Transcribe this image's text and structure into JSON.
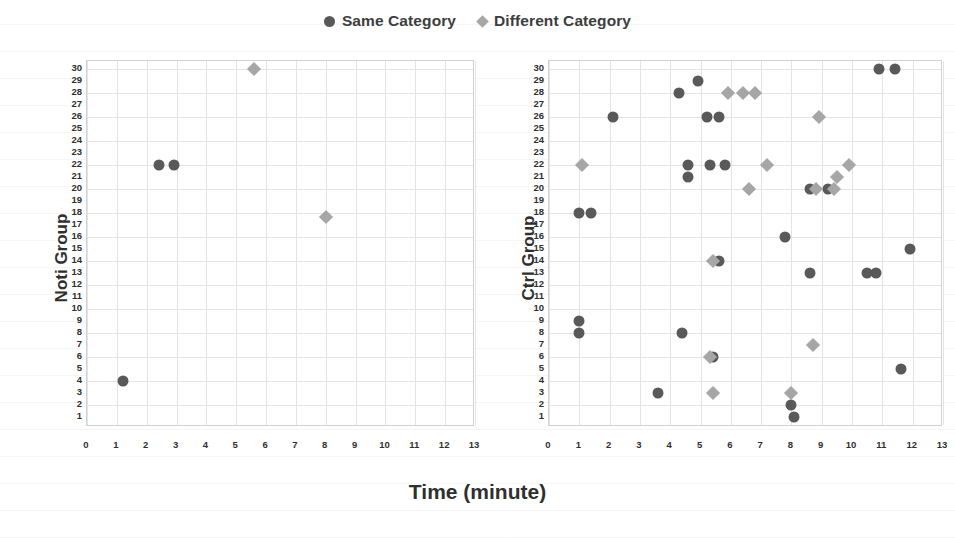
{
  "legend": {
    "items": [
      {
        "label": "Same Category",
        "marker": "circle",
        "color": "#595959"
      },
      {
        "label": "Different Category",
        "marker": "diamond",
        "color": "#a6a6a6"
      }
    ]
  },
  "axis": {
    "xlabel": "Time (minute)",
    "xticks": [
      0,
      1,
      2,
      3,
      4,
      5,
      6,
      7,
      8,
      9,
      10,
      11,
      12,
      13
    ],
    "yticks": [
      1,
      2,
      3,
      4,
      5,
      6,
      7,
      8,
      9,
      10,
      11,
      12,
      13,
      14,
      15,
      16,
      17,
      18,
      19,
      20,
      21,
      22,
      23,
      24,
      25,
      26,
      27,
      28,
      29,
      30
    ]
  },
  "panels": [
    {
      "id": "noti",
      "ylabel": "Noti Group"
    },
    {
      "id": "ctrl",
      "ylabel": "Ctrl Group"
    }
  ],
  "chart_data": [
    {
      "type": "scatter",
      "title": "Noti Group",
      "xlabel": "Time (minute)",
      "ylabel": "Noti Group",
      "xlim": [
        0,
        13
      ],
      "ylim": [
        1,
        30
      ],
      "grid": true,
      "legend_position": "top-center",
      "series": [
        {
          "name": "Same Category",
          "marker": "circle",
          "color": "#595959",
          "points": [
            {
              "x": 1.2,
              "y": 4
            },
            {
              "x": 2.4,
              "y": 22
            },
            {
              "x": 2.9,
              "y": 22
            }
          ]
        },
        {
          "name": "Different Category",
          "marker": "diamond",
          "color": "#a6a6a6",
          "points": [
            {
              "x": 5.6,
              "y": 30
            },
            {
              "x": 8.0,
              "y": 17.7
            }
          ]
        }
      ]
    },
    {
      "type": "scatter",
      "title": "Ctrl Group",
      "xlabel": "Time (minute)",
      "ylabel": "Ctrl Group",
      "xlim": [
        0,
        13
      ],
      "ylim": [
        1,
        30
      ],
      "grid": true,
      "legend_position": "top-center",
      "series": [
        {
          "name": "Same Category",
          "marker": "circle",
          "color": "#595959",
          "points": [
            {
              "x": 10.9,
              "y": 30
            },
            {
              "x": 11.4,
              "y": 30
            },
            {
              "x": 4.9,
              "y": 29
            },
            {
              "x": 4.3,
              "y": 28
            },
            {
              "x": 2.1,
              "y": 26
            },
            {
              "x": 5.2,
              "y": 26
            },
            {
              "x": 5.6,
              "y": 26
            },
            {
              "x": 4.6,
              "y": 22
            },
            {
              "x": 5.3,
              "y": 22
            },
            {
              "x": 5.8,
              "y": 22
            },
            {
              "x": 4.6,
              "y": 21
            },
            {
              "x": 8.6,
              "y": 20
            },
            {
              "x": 9.2,
              "y": 20
            },
            {
              "x": 1.0,
              "y": 18
            },
            {
              "x": 1.4,
              "y": 18
            },
            {
              "x": 7.8,
              "y": 16
            },
            {
              "x": 11.9,
              "y": 15
            },
            {
              "x": 5.6,
              "y": 14
            },
            {
              "x": 8.6,
              "y": 13
            },
            {
              "x": 10.5,
              "y": 13
            },
            {
              "x": 10.8,
              "y": 13
            },
            {
              "x": 1.0,
              "y": 9
            },
            {
              "x": 1.0,
              "y": 8
            },
            {
              "x": 4.4,
              "y": 8
            },
            {
              "x": 5.4,
              "y": 6
            },
            {
              "x": 11.6,
              "y": 5
            },
            {
              "x": 3.6,
              "y": 3
            },
            {
              "x": 8.0,
              "y": 2
            },
            {
              "x": 8.1,
              "y": 1
            }
          ]
        },
        {
          "name": "Different Category",
          "marker": "diamond",
          "color": "#a6a6a6",
          "points": [
            {
              "x": 5.9,
              "y": 28
            },
            {
              "x": 6.4,
              "y": 28
            },
            {
              "x": 6.8,
              "y": 28
            },
            {
              "x": 8.9,
              "y": 26
            },
            {
              "x": 1.1,
              "y": 22
            },
            {
              "x": 7.2,
              "y": 22
            },
            {
              "x": 9.9,
              "y": 22
            },
            {
              "x": 9.5,
              "y": 21
            },
            {
              "x": 6.6,
              "y": 20
            },
            {
              "x": 8.8,
              "y": 20
            },
            {
              "x": 9.4,
              "y": 20
            },
            {
              "x": 5.4,
              "y": 14
            },
            {
              "x": 8.7,
              "y": 7
            },
            {
              "x": 5.3,
              "y": 6
            },
            {
              "x": 5.4,
              "y": 3
            },
            {
              "x": 8.0,
              "y": 3
            }
          ]
        }
      ]
    }
  ]
}
